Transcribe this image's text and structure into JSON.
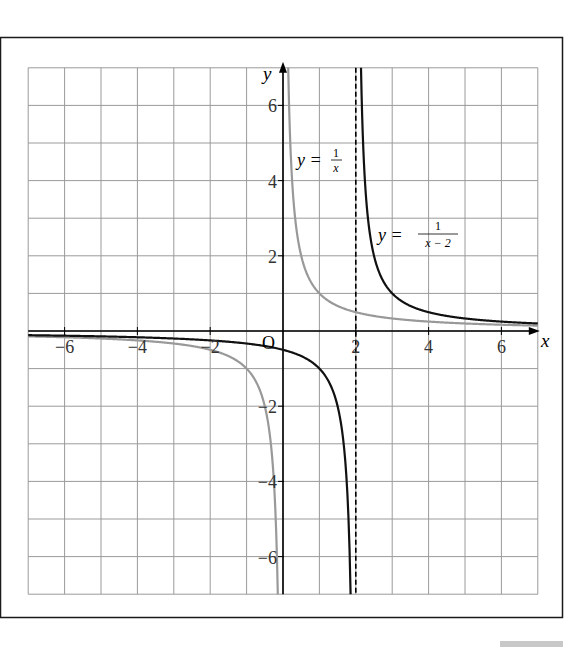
{
  "chart_data": {
    "type": "line",
    "title": "",
    "xlabel": "x",
    "ylabel": "y",
    "origin_label": "O",
    "xlim": [
      -7,
      7
    ],
    "ylim": [
      -7,
      7
    ],
    "grid": true,
    "grid_step": 1,
    "x_ticks": [
      {
        "value": -6,
        "label": "−6"
      },
      {
        "value": -4,
        "label": "−4"
      },
      {
        "value": -2,
        "label": "−2"
      },
      {
        "value": 2,
        "label": "2"
      },
      {
        "value": 4,
        "label": "4"
      },
      {
        "value": 6,
        "label": "6"
      }
    ],
    "y_ticks": [
      {
        "value": 6,
        "label": "6"
      },
      {
        "value": 4,
        "label": "4"
      },
      {
        "value": 2,
        "label": "2"
      },
      {
        "value": -2,
        "label": "−2"
      },
      {
        "value": -4,
        "label": "−4"
      },
      {
        "value": -6,
        "label": "−6"
      }
    ],
    "asymptotes": [
      {
        "type": "vertical",
        "x": 2,
        "style": "dashed"
      }
    ],
    "series": [
      {
        "name": "y = 1/x",
        "label_lhs": "y =",
        "label_num": "1",
        "label_den": "x",
        "color": "#999999",
        "formula": "1/x",
        "shift": 0,
        "points": [
          [
            -7,
            -0.143
          ],
          [
            -6,
            -0.167
          ],
          [
            -4,
            -0.25
          ],
          [
            -2,
            -0.5
          ],
          [
            -1,
            -1
          ],
          [
            -0.5,
            -2
          ],
          [
            -0.25,
            -4
          ],
          [
            -0.143,
            -7
          ],
          [
            0.143,
            7
          ],
          [
            0.25,
            4
          ],
          [
            0.5,
            2
          ],
          [
            1,
            1
          ],
          [
            2,
            0.5
          ],
          [
            4,
            0.25
          ],
          [
            6,
            0.167
          ],
          [
            7,
            0.143
          ]
        ]
      },
      {
        "name": "y = 1/(x − 2)",
        "label_lhs": "y =",
        "label_num": "1",
        "label_den": "x − 2",
        "color": "#111111",
        "formula": "1/(x-2)",
        "shift": 2,
        "points": [
          [
            -7,
            -0.111
          ],
          [
            -6,
            -0.125
          ],
          [
            -4,
            -0.167
          ],
          [
            -2,
            -0.25
          ],
          [
            0,
            -0.5
          ],
          [
            1,
            -1
          ],
          [
            1.5,
            -2
          ],
          [
            1.75,
            -4
          ],
          [
            1.857,
            -7
          ],
          [
            2.143,
            7
          ],
          [
            2.25,
            4
          ],
          [
            2.5,
            2
          ],
          [
            3,
            1
          ],
          [
            4,
            0.5
          ],
          [
            6,
            0.25
          ],
          [
            7,
            0.2
          ]
        ]
      }
    ]
  },
  "colors": {
    "grid": "#9a9a9a",
    "axis": "#000000",
    "frame": "#1a1a1a",
    "curve_reciprocal": "#999999",
    "curve_shifted": "#111111"
  }
}
